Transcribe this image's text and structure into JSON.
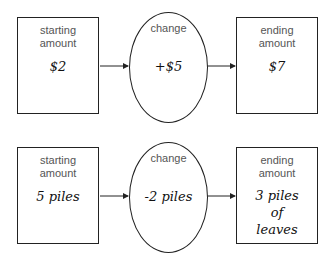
{
  "rows": [
    {
      "start": {
        "label_line1": "starting",
        "label_line2": "amount",
        "value": "$2"
      },
      "change": {
        "label": "change",
        "value": "+$5"
      },
      "end": {
        "label_line1": "ending",
        "label_line2": "amount",
        "value_line1": "$7",
        "value_line2": "",
        "value_line3": ""
      }
    },
    {
      "start": {
        "label_line1": "starting",
        "label_line2": "amount",
        "value": "5 piles"
      },
      "change": {
        "label": "change",
        "value": "-2 piles"
      },
      "end": {
        "label_line1": "ending",
        "label_line2": "amount",
        "value_line1": "3 piles",
        "value_line2": "of",
        "value_line3": "leaves"
      }
    }
  ],
  "colors": {
    "stroke": "#222222",
    "label": "#555555",
    "handwriting": "#111111"
  }
}
